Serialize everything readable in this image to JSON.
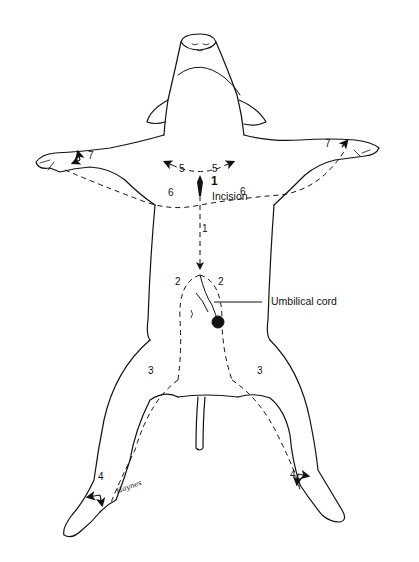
{
  "figure": {
    "labels": {
      "incision_step": "1",
      "incision": "Incision",
      "umbilical_cord": "Umbilical cord",
      "signature": "Haynes"
    },
    "line_numbers": {
      "n1": "1",
      "n2_left": "2",
      "n2_right": "2",
      "n3_left": "3",
      "n3_right": "3",
      "n4_left": "4",
      "n4_right": "4",
      "n5_left": "5",
      "n5_right": "5",
      "n6_left": "6",
      "n6_right": "6",
      "n7_left": "7",
      "n7_right": "7"
    },
    "colors": {
      "ink": "#111111",
      "background": "#ffffff"
    }
  }
}
